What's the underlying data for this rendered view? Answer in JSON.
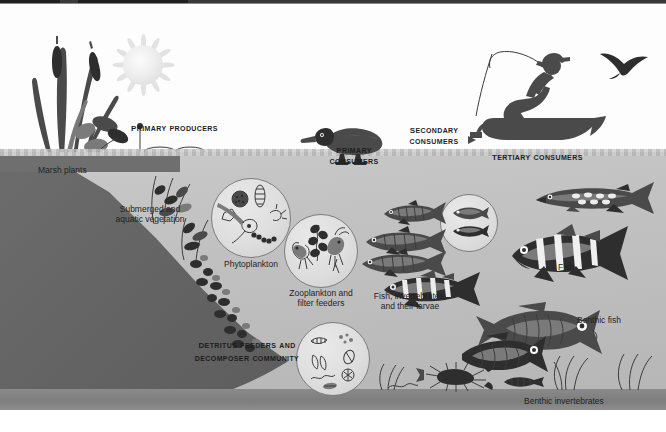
{
  "diagram": {
    "colors": {
      "sky": "#fdfdfd",
      "water": "#c3c3c3",
      "sediment_slope": "#646464",
      "lake_bed": "#7d7d7d",
      "ink": "#2e2e2e",
      "label_text": "#1f1f1f"
    }
  },
  "headings": [
    {
      "id": "primary-producers",
      "text": "Primary producers"
    },
    {
      "id": "primary-consumers",
      "line1": "Primary",
      "line2": "consumers"
    },
    {
      "id": "secondary-consumers",
      "line1": "Secondary",
      "line2": "consumers"
    },
    {
      "id": "tertiary-consumers",
      "text": "Tertiary consumers"
    },
    {
      "id": "detritus",
      "line1": "Detritus feeders and",
      "line2": "decomposer community"
    }
  ],
  "captions": [
    {
      "id": "marsh-plants",
      "text": "Marsh plants"
    },
    {
      "id": "submerged-vegetation",
      "line1": "Submerged and",
      "line2": "aquatic vegetation"
    },
    {
      "id": "phytoplankton",
      "text": "Phytoplankton"
    },
    {
      "id": "zooplankton",
      "line1": "Zooplankton and",
      "line2": "filter feeders"
    },
    {
      "id": "fish-invertebrates",
      "line1": "Fish, invertebrates,",
      "line2": "and their larvae"
    },
    {
      "id": "fish",
      "text": "Fish"
    },
    {
      "id": "benthic-fish",
      "text": "Benthic fish"
    },
    {
      "id": "benthic-invertebrates",
      "text": "Benthic invertebrates"
    }
  ],
  "organisms": [
    {
      "id": "sun",
      "name": "sun-icon"
    },
    {
      "id": "cattails",
      "name": "cattail-marsh-plants-icon"
    },
    {
      "id": "lily-pads",
      "name": "lily-pad-icon"
    },
    {
      "id": "submerged-plants",
      "name": "submerged-aquatic-plant-icon"
    },
    {
      "id": "duck",
      "name": "duck-icon"
    },
    {
      "id": "flying-bird",
      "name": "flying-bird-silhouette-icon"
    },
    {
      "id": "fisherman-boat",
      "name": "fisherman-in-boat-silhouette-icon"
    },
    {
      "id": "phytoplankton-inset",
      "name": "phytoplankton-circle-inset"
    },
    {
      "id": "zooplankton-inset",
      "name": "zooplankton-circle-inset"
    },
    {
      "id": "larvae-inset",
      "name": "fish-larvae-circle-inset"
    },
    {
      "id": "detritus-inset",
      "name": "detritus-decomposer-circle-inset"
    },
    {
      "id": "forage-fish",
      "name": "forage-fish-icon"
    },
    {
      "id": "pike",
      "name": "pike-predator-fish-icon"
    },
    {
      "id": "perch",
      "name": "perch-fish-icon"
    },
    {
      "id": "carp-pair",
      "name": "benthic-carp-fish-icon"
    },
    {
      "id": "crayfish",
      "name": "crayfish-icon"
    },
    {
      "id": "benthic-worms",
      "name": "benthic-worm-icon"
    },
    {
      "id": "bottom-weeds",
      "name": "bottom-vegetation-icon"
    }
  ]
}
